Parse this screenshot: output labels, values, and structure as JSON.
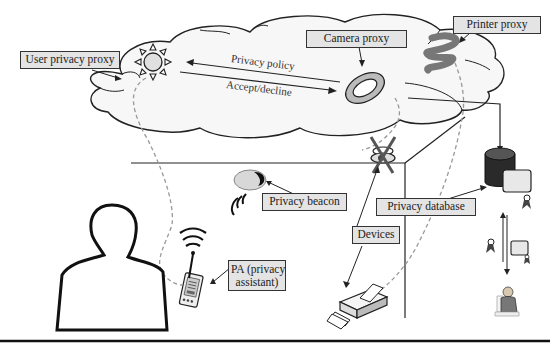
{
  "diagram": {
    "labels": {
      "user_privacy_proxy": "User privacy proxy",
      "camera_proxy": "Camera proxy",
      "printer_proxy": "Printer proxy",
      "privacy_beacon": "Privacy beacon",
      "privacy_database": "Privacy database",
      "devices": "Devices",
      "pa_line1": "PA (privacy",
      "pa_line2": "assistant)"
    },
    "flows": {
      "privacy_policy": "Privacy policy",
      "accept_decline": "Accept/decline"
    },
    "icons": [
      "sun-icon",
      "camera-ring-icon",
      "printer-scribble-icon",
      "camera-device-icon",
      "beacon-icon",
      "pda-icon",
      "printer-icon",
      "database-icon",
      "certificate-icon",
      "person-icon",
      "admin-person-icon"
    ],
    "colors": {
      "label_bg": "#e4e4e4",
      "line": "#222222",
      "dashed": "#999999",
      "cloud_fill": "#f7f7f7"
    }
  }
}
